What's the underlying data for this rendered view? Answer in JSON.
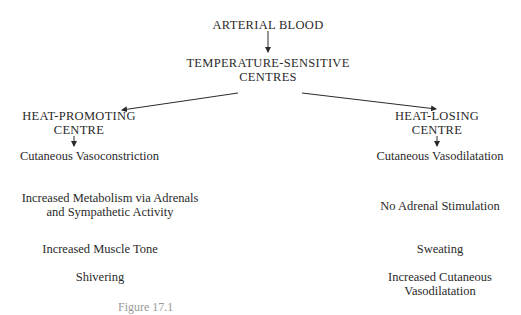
{
  "diagram": {
    "root": "ARTERIAL BLOOD",
    "centre": {
      "line1": "TEMPERATURE-SENSITIVE",
      "line2": "CENTRES"
    },
    "left": {
      "title1": "HEAT-PROMOTING",
      "title2": "CENTRE",
      "effects": [
        "Cutaneous Vasoconstriction",
        "Increased Metabolism via Adrenals",
        "and Sympathetic Activity",
        "Increased Muscle Tone",
        "Shivering"
      ]
    },
    "right": {
      "title1": "HEAT-LOSING",
      "title2": "CENTRE",
      "effects": [
        "Cutaneous Vasodilatation",
        "No Adrenal Stimulation",
        "Sweating",
        "Increased Cutaneous",
        "Vasodilatation"
      ]
    },
    "caption": "Figure 17.1"
  }
}
